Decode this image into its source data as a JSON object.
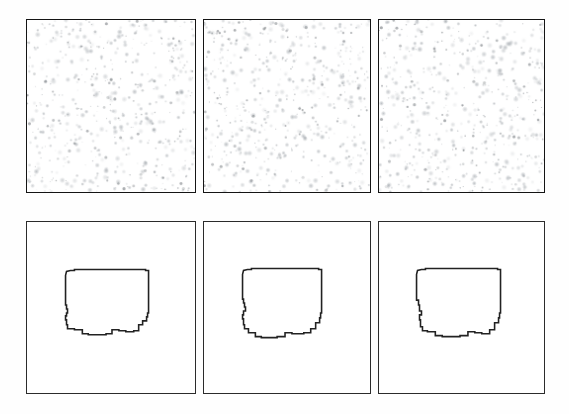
{
  "figure": {
    "title": "",
    "background_color": "#fefefe",
    "width": 569,
    "height": 414,
    "rows": 2,
    "columns": 3,
    "row_labels": [
      "noise-texture-row",
      "extracted-contour-row"
    ],
    "panel_border_color": "#1a1a1a",
    "shape_stroke_color": "#222222",
    "speckle_color": "#9aa0a6"
  },
  "panels": [
    {
      "id": "panel-top-left",
      "row": 0,
      "column": 0,
      "type": "noise",
      "label": "",
      "x": 26,
      "y": 19,
      "width": 170,
      "height": 174,
      "speckle_count": 430,
      "speckle_seed": 11,
      "speckle_min_radius": 0.8,
      "speckle_max_radius": 3.1,
      "speckle_opacity": 0.55
    },
    {
      "id": "panel-top-middle",
      "row": 0,
      "column": 1,
      "type": "noise",
      "label": "",
      "x": 203,
      "y": 19,
      "width": 168,
      "height": 174,
      "speckle_count": 430,
      "speckle_seed": 27,
      "speckle_min_radius": 0.8,
      "speckle_max_radius": 3.1,
      "speckle_opacity": 0.55
    },
    {
      "id": "panel-top-right",
      "row": 0,
      "column": 2,
      "type": "noise",
      "label": "",
      "x": 378,
      "y": 19,
      "width": 167,
      "height": 174,
      "speckle_count": 430,
      "speckle_seed": 43,
      "speckle_min_radius": 0.8,
      "speckle_max_radius": 3.1,
      "speckle_opacity": 0.55
    },
    {
      "id": "panel-bottom-left",
      "row": 1,
      "column": 0,
      "type": "shape",
      "label": "",
      "x": 26,
      "y": 221,
      "width": 170,
      "height": 173,
      "shape_viewbox": "0 0 170 173",
      "shape_path": "M 39 54 L 40 50 L 44 49 L 48 49 L 48 48 L 120 48 L 120 49 L 123 49 L 123 92 L 122 92 L 122 96 L 121 96 L 121 100 L 117 100 L 117 104 L 113 104 L 113 110 L 108 110 L 108 111 L 100 111 L 100 110 L 93 110 L 93 109 L 86 109 L 86 113 L 80 113 L 80 114 L 62 114 L 62 113 L 56 113 L 56 109 L 48 109 L 48 108 L 41 108 L 41 104 L 40 104 L 40 99 L 39 99 L 39 95 L 40 95 L 40 92 L 41 92 L 41 88 L 40 88 L 40 84 L 39 84 Z"
    },
    {
      "id": "panel-bottom-middle",
      "row": 1,
      "column": 1,
      "type": "shape",
      "label": "",
      "x": 203,
      "y": 221,
      "width": 168,
      "height": 173,
      "shape_viewbox": "0 0 168 173",
      "shape_path": "M 39 53 L 40 49 L 44 48 L 48 48 L 48 47 L 116 47 L 116 48 L 119 48 L 119 92 L 118 92 L 118 97 L 117 97 L 117 102 L 113 102 L 113 108 L 108 108 L 108 112 L 101 112 L 101 113 L 89 113 L 89 112 L 82 112 L 82 116 L 74 116 L 74 117 L 58 117 L 58 116 L 52 116 L 52 112 L 45 112 L 45 108 L 41 108 L 41 104 L 40 104 L 40 98 L 39 98 L 39 94 L 40 94 L 40 90 L 42 90 L 42 86 L 41 86 L 41 82 L 40 82 L 40 78 L 39 78 Z"
    },
    {
      "id": "panel-bottom-right",
      "row": 1,
      "column": 2,
      "type": "shape",
      "label": "",
      "x": 378,
      "y": 221,
      "width": 167,
      "height": 173,
      "shape_viewbox": "0 0 167 173",
      "shape_path": "M 38 53 L 39 49 L 43 48 L 47 48 L 47 47 L 120 47 L 120 48 L 123 48 L 123 92 L 122 92 L 122 97 L 121 97 L 121 102 L 117 102 L 117 109 L 112 109 L 112 113 L 104 113 L 104 112 L 97 112 L 97 111 L 90 111 L 90 115 L 82 115 L 82 116 L 64 116 L 64 115 L 57 115 L 57 111 L 49 111 L 49 110 L 44 110 L 44 106 L 42 106 L 42 99 L 41 99 L 41 94 L 43 94 L 43 90 L 41 90 L 41 84 L 40 84 L 40 79 L 38 79 Z"
    }
  ]
}
